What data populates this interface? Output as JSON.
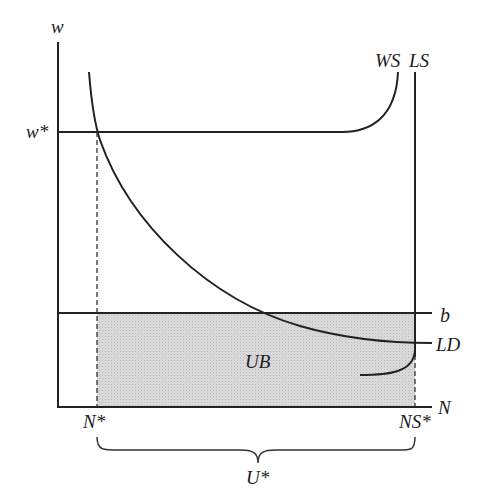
{
  "diagram": {
    "axes": {
      "y_label": "w",
      "x_label": "N"
    },
    "labels": {
      "wage_equilibrium": "w*",
      "wage_setting": "WS",
      "labour_supply": "LS",
      "benefit_level": "b",
      "labour_demand": "LD",
      "unemployment_benefit_area": "UB",
      "employment_equilibrium": "N*",
      "labour_supply_equilibrium": "NS*",
      "unemployment": "U*"
    },
    "colors": {
      "line": "#222222",
      "shade": "#d6d6d6",
      "background": "#ffffff"
    }
  }
}
